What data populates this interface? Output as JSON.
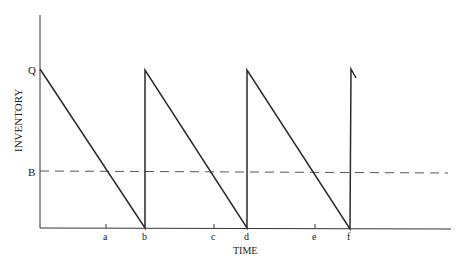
{
  "diagram": {
    "title": "",
    "axes": {
      "ylabel": "INVENTORY",
      "xlabel": "TIME",
      "y_levels": {
        "Q": "Q",
        "B": "B"
      },
      "x_ticks": [
        "a",
        "b",
        "c",
        "d",
        "e",
        "f"
      ]
    },
    "colors": {
      "line": "#2a2a2a",
      "dashed": "#555555"
    }
  }
}
